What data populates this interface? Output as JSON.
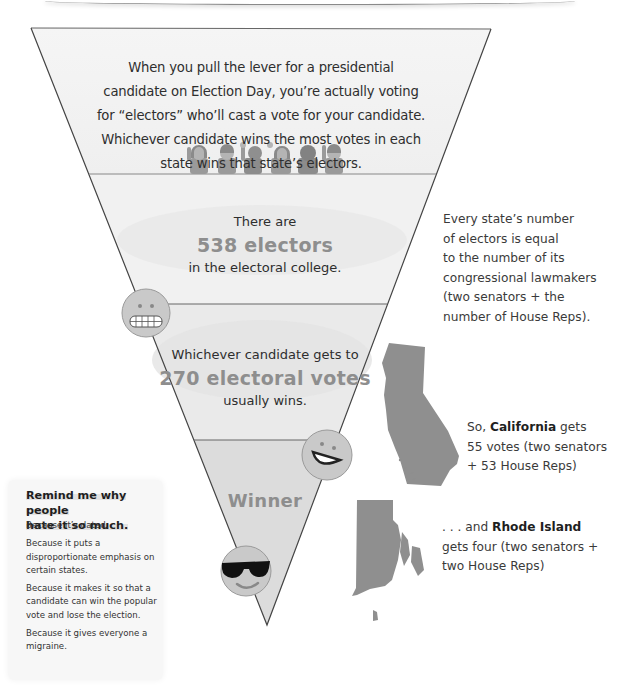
{
  "funnel": {
    "sections": [
      {
        "id": "intro",
        "text": "When you pull the lever for a presidential candidate on Election Day, you’re actually voting for “electors” who’ll cast a vote for your candidate. Whichever candidate wins the most votes in each state wins that state’s electors.",
        "illustration": "six-voters-raising-hands"
      },
      {
        "id": "electors",
        "pre": "There are",
        "highlight": "538 electors",
        "post": "in the electoral college.",
        "emoji": "grimacing-face-icon"
      },
      {
        "id": "threshold",
        "pre": "Whichever candidate gets to",
        "highlight": "270 electoral votes",
        "post": "usually wins.",
        "emoji": "grinning-face-icon"
      },
      {
        "id": "winner",
        "highlight": "Winner",
        "emoji": "sunglasses-face-icon"
      }
    ]
  },
  "notes": {
    "electors_rule": "Every state’s number of electors is equal to the number of its congressional lawmakers (two senators + the number of House Reps).",
    "electors_rule_lines": [
      "Every state’s number",
      "of electors is equal",
      "to the number of its",
      "congressional lawmakers",
      "(two senators + the",
      "number of House Reps)."
    ],
    "california": {
      "pre": "So, ",
      "state": "California",
      "post": " gets",
      "line2": "55 votes (two senators",
      "line3": "+ 53 House Reps)",
      "map": "california-map-icon"
    },
    "rhode_island": {
      "pre": ". . . and ",
      "state": "Rhode Island",
      "line2": "gets four (two senators +",
      "line3": "two House Reps)",
      "map": "rhode-island-map-icon"
    }
  },
  "sidebar": {
    "title_line1": "Remind me why people",
    "title_line2": "hate it so much.",
    "reasons": [
      "Because it’s dated.",
      "Because it puts a disproportionate emphasis on certain states.",
      "Because it makes it so that a candidate can win the popular vote and lose the election.",
      "Because it gives everyone a migraine."
    ]
  },
  "colors": {
    "funnel_fill_top": "#f3f3f3",
    "funnel_fill_mid": "#ececec",
    "funnel_fill_bottom": "#dcdcdc",
    "outline": "#555555",
    "highlight_text": "#8e8e8e",
    "map_fill": "#8a8a8a",
    "emoji_fill": "#c9c9c9"
  }
}
